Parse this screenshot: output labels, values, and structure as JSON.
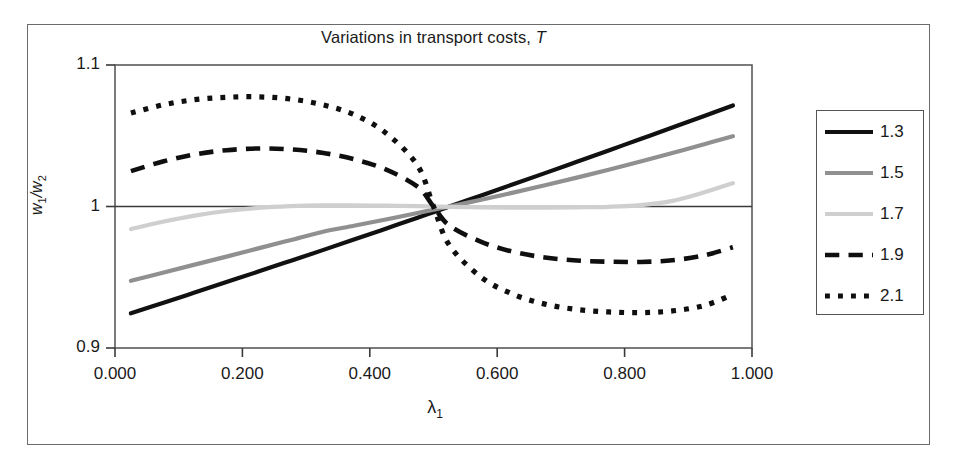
{
  "chart_data": {
    "type": "line",
    "title": "Variations in transport costs, T",
    "title_plain": "Variations in transport costs,",
    "title_italic": "T",
    "xlabel": "λ",
    "xlabel_sub": "1",
    "ylabel": "w",
    "ylabel_sub1": "1",
    "ylabel_sub2": "2",
    "ylabel_full": "w1/w2",
    "xlim": [
      0.0,
      1.0
    ],
    "ylim": [
      0.9,
      1.1
    ],
    "xticks": [
      "0.000",
      "0.200",
      "0.400",
      "0.600",
      "0.800",
      "1.000"
    ],
    "xtick_values": [
      0.0,
      0.2,
      0.4,
      0.6,
      0.8,
      1.0
    ],
    "yticks": [
      "0.9",
      "1",
      "1.1"
    ],
    "ytick_values": [
      0.9,
      1.0,
      1.1
    ],
    "grid": false,
    "zero_line_y": 1.0,
    "legend_position": "right-outside",
    "legend_title": "",
    "x": [
      0.025,
      0.075,
      0.125,
      0.175,
      0.225,
      0.275,
      0.325,
      0.375,
      0.425,
      0.475,
      0.5,
      0.525,
      0.575,
      0.625,
      0.675,
      0.725,
      0.775,
      0.825,
      0.875,
      0.925,
      0.97
    ],
    "series": [
      {
        "name": "1.3",
        "color": "#111111",
        "style": "solid",
        "width": 4.2,
        "values": [
          0.9245,
          0.9318,
          0.9392,
          0.9466,
          0.954,
          0.9615,
          0.969,
          0.9766,
          0.9843,
          0.9921,
          0.996,
          1.0,
          1.0078,
          1.0157,
          1.0236,
          1.0316,
          1.0396,
          1.0477,
          1.0558,
          1.064,
          1.0714
        ]
      },
      {
        "name": "1.5",
        "color": "#909090",
        "style": "solid",
        "width": 4.2,
        "values": [
          0.9475,
          0.9532,
          0.9589,
          0.9646,
          0.9704,
          0.9762,
          0.982,
          0.9864,
          0.9908,
          0.9954,
          0.9978,
          1.0,
          1.0048,
          1.0098,
          1.015,
          1.0204,
          1.026,
          1.0318,
          1.0378,
          1.044,
          1.0497
        ]
      },
      {
        "name": "1.7",
        "color": "#cfcfcf",
        "style": "solid",
        "width": 4.2,
        "values": [
          0.984,
          0.9892,
          0.9936,
          0.9968,
          0.999,
          1.0002,
          1.0008,
          1.0008,
          1.0006,
          1.0003,
          1.0,
          0.9998,
          0.9994,
          0.9992,
          0.9992,
          0.9994,
          0.9998,
          1.001,
          1.004,
          1.01,
          1.0165
        ]
      },
      {
        "name": "1.9",
        "color": "#0f0f0f",
        "style": "dashed",
        "width": 4.6,
        "values": [
          1.025,
          1.0318,
          1.0368,
          1.0398,
          1.041,
          1.0404,
          1.038,
          1.0334,
          1.0262,
          1.014,
          1.0,
          0.9865,
          0.975,
          0.968,
          0.964,
          0.9618,
          0.961,
          0.9608,
          0.962,
          0.9655,
          0.9712
        ]
      },
      {
        "name": "2.1",
        "color": "#0f0f0f",
        "style": "dotted",
        "width": 5.2,
        "values": [
          1.066,
          1.0718,
          1.0755,
          1.0772,
          1.0775,
          1.076,
          1.072,
          1.065,
          1.052,
          1.029,
          1.0,
          0.9726,
          0.95,
          0.938,
          0.931,
          0.9272,
          0.9255,
          0.925,
          0.9262,
          0.93,
          0.9378
        ]
      }
    ]
  },
  "legend": {
    "items": [
      {
        "label": "1.3"
      },
      {
        "label": "1.5"
      },
      {
        "label": "1.7"
      },
      {
        "label": "1.9"
      },
      {
        "label": "2.1"
      }
    ]
  }
}
